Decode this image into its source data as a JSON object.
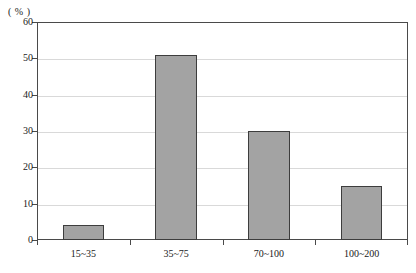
{
  "chart_data": {
    "type": "bar",
    "title": "",
    "subtitle": "",
    "xlabel": "",
    "ylabel": "( % )",
    "unit_label": "( % )",
    "categories": [
      "15~35",
      "35~75",
      "70~100",
      "100~200"
    ],
    "values": [
      4,
      51,
      30,
      15
    ],
    "series": [
      {
        "name": "",
        "values": [
          4,
          51,
          30,
          15
        ]
      }
    ],
    "ylim": [
      0,
      60
    ],
    "ytick_step": 10,
    "yticks": [
      0,
      10,
      20,
      30,
      40,
      50,
      60
    ],
    "ytick_labels": [
      "0",
      "10",
      "20",
      "30",
      "40",
      "50",
      "60"
    ],
    "xlim_categories": 4,
    "grid": {
      "horizontal": true,
      "vertical": false,
      "color": "#d9d9d9"
    },
    "legend": {
      "visible": false,
      "position": "none",
      "entries": []
    },
    "annotations": [],
    "colors": {
      "bar_fill": "#a3a3a3",
      "bar_border": "#3d3d3d",
      "axis": "#4a4a4a",
      "grid": "#d9d9d9",
      "text": "#1a1a1a",
      "background": "#ffffff"
    }
  }
}
